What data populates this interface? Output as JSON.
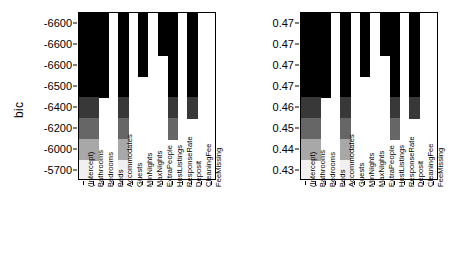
{
  "chart_data": [
    {
      "type": "heatmap",
      "title": "",
      "panel": "bic",
      "ylabel": "bic",
      "xlabel": "",
      "grid": false,
      "legend": "none",
      "ytick_labels": [
        "-6600",
        "-6600",
        "-6600",
        "-6500",
        "-6400",
        "-6200",
        "-6000",
        "-5700"
      ],
      "ytick_values": [
        -6600,
        -6600,
        -6600,
        -6500,
        -6400,
        -6200,
        -6000,
        -5700
      ],
      "categories": [
        "(Intercept)",
        "Bathrooms",
        "Bedrooms",
        "Beds",
        "Accommodates",
        "Guests",
        "MinNights",
        "MaxNights",
        "ExtraPeople",
        "HostListings",
        "ResponseRate",
        "Deposit",
        "CleaningFee",
        "FeeMissing"
      ],
      "rows": [
        {
          "label": "-6600",
          "shade": 0.0,
          "selected": [
            1,
            1,
            1,
            0,
            1,
            0,
            1,
            0,
            1,
            1,
            0,
            1,
            0,
            0
          ]
        },
        {
          "label": "-6600",
          "shade": 0.0,
          "selected": [
            1,
            1,
            1,
            0,
            1,
            0,
            1,
            0,
            1,
            1,
            0,
            1,
            0,
            0
          ]
        },
        {
          "label": "-6600",
          "shade": 0.0,
          "selected": [
            1,
            1,
            1,
            0,
            1,
            0,
            1,
            0,
            0,
            1,
            0,
            1,
            0,
            0
          ]
        },
        {
          "label": "-6500",
          "shade": 0.0,
          "selected": [
            1,
            1,
            1,
            0,
            1,
            0,
            0,
            0,
            0,
            1,
            0,
            1,
            0,
            0
          ]
        },
        {
          "label": "-6400",
          "shade": 0.22,
          "selected": [
            1,
            1,
            0,
            0,
            1,
            0,
            0,
            0,
            0,
            1,
            0,
            1,
            0,
            0
          ]
        },
        {
          "label": "-6200",
          "shade": 0.4,
          "selected": [
            1,
            1,
            0,
            0,
            1,
            0,
            0,
            0,
            0,
            1,
            0,
            0,
            0,
            0
          ]
        },
        {
          "label": "-6000",
          "shade": 0.66,
          "selected": [
            1,
            1,
            0,
            0,
            1,
            0,
            0,
            0,
            0,
            0,
            0,
            0,
            0,
            0
          ]
        },
        {
          "label": "-5700",
          "shade": 0.94,
          "selected": [
            1,
            0,
            0,
            0,
            1,
            0,
            0,
            0,
            0,
            0,
            0,
            0,
            0,
            0
          ]
        }
      ]
    },
    {
      "type": "heatmap",
      "title": "",
      "panel": "adjr2",
      "ylabel": "adjr2",
      "xlabel": "",
      "grid": false,
      "legend": "none",
      "ytick_labels": [
        "0.47",
        "0.47",
        "0.47",
        "0.47",
        "0.46",
        "0.45",
        "0.44",
        "0.43"
      ],
      "ytick_values": [
        0.47,
        0.47,
        0.47,
        0.47,
        0.46,
        0.45,
        0.44,
        0.43
      ],
      "categories": [
        "(Intercept)",
        "Bathrooms",
        "Bedrooms",
        "Beds",
        "Accommodates",
        "Guests",
        "MinNights",
        "MaxNights",
        "ExtraPeople",
        "HostListings",
        "ResponseRate",
        "Deposit",
        "CleaningFee",
        "FeeMissing"
      ],
      "rows": [
        {
          "label": "0.47",
          "shade": 0.0,
          "selected": [
            1,
            1,
            1,
            0,
            1,
            0,
            1,
            0,
            1,
            1,
            0,
            1,
            0,
            0
          ]
        },
        {
          "label": "0.47",
          "shade": 0.0,
          "selected": [
            1,
            1,
            1,
            0,
            1,
            0,
            1,
            0,
            1,
            1,
            0,
            1,
            0,
            0
          ]
        },
        {
          "label": "0.47",
          "shade": 0.0,
          "selected": [
            1,
            1,
            1,
            0,
            1,
            0,
            1,
            0,
            0,
            1,
            0,
            1,
            0,
            0
          ]
        },
        {
          "label": "0.47",
          "shade": 0.0,
          "selected": [
            1,
            1,
            1,
            0,
            1,
            0,
            0,
            0,
            0,
            1,
            0,
            1,
            0,
            0
          ]
        },
        {
          "label": "0.46",
          "shade": 0.22,
          "selected": [
            1,
            1,
            0,
            0,
            1,
            0,
            0,
            0,
            0,
            1,
            0,
            1,
            0,
            0
          ]
        },
        {
          "label": "0.45",
          "shade": 0.4,
          "selected": [
            1,
            1,
            0,
            0,
            1,
            0,
            0,
            0,
            0,
            1,
            0,
            0,
            0,
            0
          ]
        },
        {
          "label": "0.44",
          "shade": 0.66,
          "selected": [
            1,
            1,
            0,
            0,
            1,
            0,
            0,
            0,
            0,
            0,
            0,
            0,
            0,
            0
          ]
        },
        {
          "label": "0.43",
          "shade": 0.94,
          "selected": [
            1,
            0,
            0,
            0,
            1,
            0,
            0,
            0,
            0,
            0,
            0,
            0,
            0,
            0
          ]
        }
      ]
    }
  ],
  "colors": {
    "background": "#ffffff",
    "axis": "#000000",
    "text": "#000000",
    "cell_dark": "#000000",
    "cell_empty": "#ffffff"
  }
}
